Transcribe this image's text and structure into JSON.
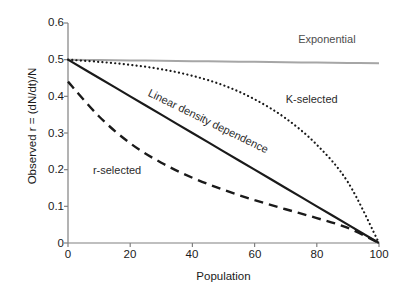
{
  "chart_data": {
    "type": "line",
    "title": "",
    "xlabel": "Population",
    "ylabel": "Observed r = (dN/dt)/N",
    "xlim": [
      0,
      100
    ],
    "ylim": [
      0,
      0.6
    ],
    "grid": false,
    "legend_position": "inline-annotations",
    "xticks": [
      "0",
      "20",
      "40",
      "60",
      "80",
      "100"
    ],
    "xtick_values": [
      0,
      20,
      40,
      60,
      80,
      100
    ],
    "yticks": [
      "0",
      "0.1",
      "0.2",
      "0.3",
      "0.4",
      "0.5",
      "0.6"
    ],
    "ytick_values": [
      0,
      0.1,
      0.2,
      0.3,
      0.4,
      0.5,
      0.6
    ],
    "x": [
      0,
      10,
      20,
      30,
      40,
      50,
      60,
      70,
      80,
      90,
      100
    ],
    "series": [
      {
        "name": "Exponential",
        "style": "solid",
        "color": "#a6a6a6",
        "width": 2.0,
        "values": [
          0.5,
          0.499,
          0.498,
          0.497,
          0.496,
          0.495,
          0.494,
          0.493,
          0.492,
          0.491,
          0.49
        ]
      },
      {
        "name": "Linear density dependence",
        "style": "solid",
        "color": "#1a1a1a",
        "width": 2.2,
        "values": [
          0.5,
          0.45,
          0.4,
          0.35,
          0.3,
          0.25,
          0.2,
          0.15,
          0.1,
          0.05,
          0.0
        ]
      },
      {
        "name": "K-selected",
        "style": "dotted",
        "color": "#1a1a1a",
        "width": 2.2,
        "values": [
          0.5,
          0.494,
          0.486,
          0.474,
          0.456,
          0.43,
          0.392,
          0.34,
          0.268,
          0.166,
          0.0
        ]
      },
      {
        "name": "r-selected",
        "style": "dashed",
        "color": "#1a1a1a",
        "width": 2.4,
        "values": [
          0.44,
          0.345,
          0.272,
          0.219,
          0.178,
          0.145,
          0.117,
          0.092,
          0.068,
          0.041,
          0.0
        ]
      }
    ],
    "annotations": [
      {
        "text": "Exponential",
        "x": 74,
        "y": 0.555,
        "rotation": 0,
        "color": "#4d4d4d"
      },
      {
        "text": "Linear density dependence",
        "x": 26,
        "y": 0.41,
        "rotation": 26,
        "color": "#2b2b2b"
      },
      {
        "text": "K-selected",
        "x": 70,
        "y": 0.39,
        "rotation": 0,
        "color": "#2b2b2b"
      },
      {
        "text": "r-selected",
        "x": 8,
        "y": 0.196,
        "rotation": 0,
        "color": "#2b2b2b"
      }
    ],
    "axis_color": "#808080"
  }
}
